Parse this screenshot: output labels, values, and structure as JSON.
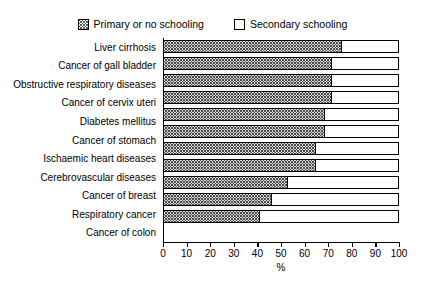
{
  "chart_data": {
    "type": "bar",
    "orientation": "horizontal",
    "stacked": true,
    "title": "",
    "subtitle": "",
    "xlabel": "%",
    "ylabel": "",
    "xlim": [
      0,
      100
    ],
    "xticks": [
      0,
      10,
      20,
      30,
      40,
      50,
      60,
      70,
      80,
      90,
      100
    ],
    "xticklabels": [
      "0",
      "10",
      "20",
      "30",
      "40",
      "50",
      "60",
      "70",
      "80",
      "90",
      "100"
    ],
    "grid": false,
    "legend_position": "top-center",
    "categories": [
      "Liver cirrhosis",
      "Cancer of gall bladder",
      "Obstructive respiratory diseases",
      "Cancer of cervix uteri",
      "Diabetes mellitus",
      "Cancer of stomach",
      "Ischaemic heart diseases",
      "Cerebrovascular diseases",
      "Cancer of breast",
      "Respiratory cancer",
      "Cancer of colon"
    ],
    "series": [
      {
        "name": "Primary or no schooling",
        "pattern": "dotted",
        "color": "#d6d6d6",
        "values": [
          76,
          72,
          72,
          72,
          69,
          69,
          65,
          65,
          53,
          46,
          41
        ]
      },
      {
        "name": "Secondary schooling",
        "pattern": "solid",
        "color": "#ffffff",
        "values": [
          24,
          28,
          28,
          28,
          31,
          31,
          35,
          35,
          47,
          54,
          59
        ]
      }
    ]
  },
  "legend": {
    "items": [
      {
        "label": "Primary or no schooling",
        "swatch": "dotted-pattern-swatch"
      },
      {
        "label": "Secondary schooling",
        "swatch": "white-swatch"
      }
    ]
  },
  "axis": {
    "x_title": "%"
  },
  "colors": {
    "axis": "#000000",
    "bar_border": "#000000",
    "primary_fill": "#d6d6d6",
    "secondary_fill": "#ffffff",
    "background": "#ffffff"
  }
}
